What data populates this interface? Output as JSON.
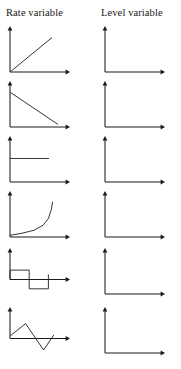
{
  "header": {
    "rate_column_title": "Rate variable",
    "level_column_title": "Level variable"
  },
  "colors": {
    "axis": "#1b1b1b",
    "plot": "#2a2a2a",
    "background": "#ffffff",
    "text": "#161616"
  },
  "chart_data": [
    {
      "type": "line",
      "title": "Rate variable",
      "row": 1,
      "column": "rate",
      "xlabel": "",
      "ylabel": "",
      "grid": false,
      "legend": "none",
      "shape": "linear-increase",
      "description": "Straight line rising from the origin at about 45 degrees",
      "xlim": [
        0,
        10
      ],
      "ylim": [
        0,
        10
      ],
      "x": [
        0,
        7
      ],
      "y": [
        0,
        8.2
      ]
    },
    {
      "type": "line",
      "title": "Level variable",
      "row": 1,
      "column": "level",
      "xlabel": "",
      "ylabel": "",
      "grid": false,
      "legend": "none",
      "shape": "blank",
      "description": "Empty axes, no plotted curve",
      "xlim": [
        0,
        10
      ],
      "ylim": [
        0,
        10
      ],
      "x": [],
      "y": []
    },
    {
      "type": "line",
      "title": "Rate variable",
      "row": 2,
      "column": "rate",
      "xlabel": "",
      "ylabel": "",
      "grid": false,
      "legend": "none",
      "shape": "linear-decrease",
      "description": "Straight line falling from a high value on the vertical axis down toward the horizontal axis",
      "xlim": [
        0,
        10
      ],
      "ylim": [
        0,
        10
      ],
      "x": [
        0,
        8
      ],
      "y": [
        8.3,
        0.6
      ]
    },
    {
      "type": "line",
      "title": "Level variable",
      "row": 2,
      "column": "level",
      "xlabel": "",
      "ylabel": "",
      "grid": false,
      "legend": "none",
      "shape": "blank",
      "description": "Empty axes, no plotted curve",
      "xlim": [
        0,
        10
      ],
      "ylim": [
        0,
        10
      ],
      "x": [],
      "y": []
    },
    {
      "type": "line",
      "title": "Rate variable",
      "row": 3,
      "column": "rate",
      "xlabel": "",
      "ylabel": "",
      "grid": false,
      "legend": "none",
      "shape": "constant",
      "description": "Flat horizontal line at a constant positive value, ending partway across",
      "xlim": [
        0,
        10
      ],
      "ylim": [
        0,
        10
      ],
      "x": [
        0,
        6.5
      ],
      "y": [
        5.6,
        5.6
      ]
    },
    {
      "type": "line",
      "title": "Level variable",
      "row": 3,
      "column": "level",
      "xlabel": "",
      "ylabel": "",
      "grid": false,
      "legend": "none",
      "shape": "blank",
      "description": "Empty axes, no plotted curve",
      "xlim": [
        0,
        10
      ],
      "ylim": [
        0,
        10
      ],
      "x": [],
      "y": []
    },
    {
      "type": "line",
      "title": "Rate variable",
      "row": 4,
      "column": "rate",
      "xlabel": "",
      "ylabel": "",
      "grid": false,
      "legend": "none",
      "shape": "exponential-growth",
      "description": "Curve that is nearly flat near the origin then bends sharply upward",
      "xlim": [
        0,
        10
      ],
      "ylim": [
        0,
        10
      ],
      "x": [
        0,
        2,
        4,
        5.5,
        6.4,
        6.9,
        7.1
      ],
      "y": [
        0.4,
        0.9,
        1.6,
        2.8,
        4.4,
        6.6,
        8.4
      ]
    },
    {
      "type": "line",
      "title": "Level variable",
      "row": 4,
      "column": "level",
      "xlabel": "",
      "ylabel": "",
      "grid": false,
      "legend": "none",
      "shape": "blank",
      "description": "Empty axes, no plotted curve",
      "xlim": [
        0,
        10
      ],
      "ylim": [
        0,
        10
      ],
      "x": [],
      "y": []
    },
    {
      "type": "line",
      "title": "Rate variable",
      "row": 5,
      "column": "rate",
      "xlabel": "",
      "ylabel": "",
      "grid": false,
      "legend": "none",
      "shape": "square-pulse-positive-then-negative",
      "description": "Square wave: steps up to a positive plateau, drops to an equal negative plateau, then steps back up to zero",
      "xlim": [
        0,
        10
      ],
      "ylim": [
        -5,
        10
      ],
      "x": [
        0,
        0,
        3.2,
        3.2,
        6.4,
        6.4
      ],
      "y": [
        0,
        3.4,
        3.4,
        -3.4,
        -3.4,
        1.8
      ]
    },
    {
      "type": "line",
      "title": "Level variable",
      "row": 5,
      "column": "level",
      "xlabel": "",
      "ylabel": "",
      "grid": false,
      "legend": "none",
      "shape": "blank",
      "description": "Empty axes, no plotted curve",
      "xlim": [
        0,
        10
      ],
      "ylim": [
        0,
        10
      ],
      "x": [],
      "y": []
    },
    {
      "type": "line",
      "title": "Rate variable",
      "row": 6,
      "column": "rate",
      "xlabel": "",
      "ylabel": "",
      "grid": false,
      "legend": "none",
      "shape": "triangular-zigzag",
      "description": "Zigzag: rises from the origin to a peak, falls steeply through the axis to a trough below it, then rises back up",
      "xlim": [
        0,
        10
      ],
      "ylim": [
        -5,
        10
      ],
      "x": [
        0,
        2.6,
        5.6,
        7.3
      ],
      "y": [
        0.9,
        5.4,
        -4.2,
        1.3
      ]
    },
    {
      "type": "line",
      "title": "Level variable",
      "row": 6,
      "column": "level",
      "xlabel": "",
      "ylabel": "",
      "grid": false,
      "legend": "none",
      "shape": "blank",
      "description": "Empty axes, no plotted curve",
      "xlim": [
        0,
        10
      ],
      "ylim": [
        0,
        10
      ],
      "x": [],
      "y": []
    }
  ]
}
